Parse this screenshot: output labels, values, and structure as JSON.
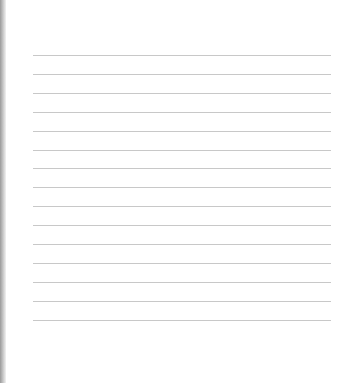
{
  "paper": {
    "type": "lined-paper",
    "line_count": 15,
    "line_color": "#c8c8c8",
    "edge_color": "#9a9a9a"
  }
}
